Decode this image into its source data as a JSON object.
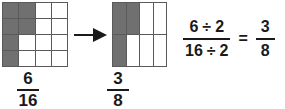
{
  "diagram": {
    "shade_color": "#707070",
    "grid_line_color": "#5a5a5a",
    "text_color": "#1a1a1a",
    "background_color": "#ffffff"
  },
  "model_before": {
    "name": "sixteenths-grid",
    "columns": 4,
    "rows": 4,
    "total_cells": 16,
    "shaded_cells": 6,
    "cells": [
      [
        1,
        1,
        0,
        0
      ],
      [
        1,
        1,
        0,
        0
      ],
      [
        1,
        0,
        0,
        0
      ],
      [
        1,
        0,
        0,
        0
      ]
    ],
    "label": {
      "numerator": "6",
      "denominator": "16"
    }
  },
  "arrow": {
    "name": "right-arrow-icon",
    "direction": "right"
  },
  "model_after": {
    "name": "eighths-grid",
    "columns": 4,
    "rows": 2,
    "total_cells": 8,
    "shaded_cells": 3,
    "cells": [
      [
        1,
        1,
        0,
        0
      ],
      [
        1,
        0,
        0,
        0
      ]
    ],
    "label": {
      "numerator": "3",
      "denominator": "8"
    }
  },
  "equation": {
    "left_fraction": {
      "numerator_value": "6",
      "numerator_operator": "÷",
      "numerator_divisor": "2",
      "denominator_value": "16",
      "denominator_operator": "÷",
      "denominator_divisor": "2"
    },
    "equals": "=",
    "right_fraction": {
      "numerator": "3",
      "denominator": "8"
    }
  }
}
